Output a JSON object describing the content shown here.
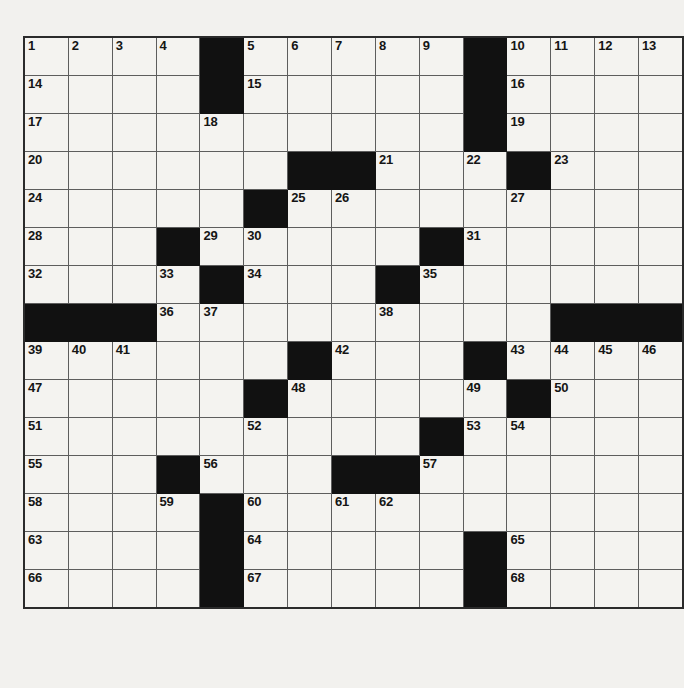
{
  "puzzle": {
    "title": "Crossword Puzzle Grid",
    "rows": 17,
    "columns": 14,
    "cell_width_px": 46,
    "cell_height_px": 37,
    "colors": {
      "paper_background": "#f2f1ee",
      "cell_background": "#f4f3f0",
      "block_fill": "#111111",
      "grid_line": "#5d5d5d",
      "outer_border": "#2b2b2b",
      "number_text": "#151515"
    },
    "highest_clue_number": 68,
    "total_cells": 238,
    "block_count": 46,
    "legend": {
      "block_label": "blocked-square",
      "open_label": "open-square"
    },
    "grid": [
      [
        {
          "type": "open",
          "number": "1"
        },
        {
          "type": "open",
          "number": "2"
        },
        {
          "type": "open",
          "number": "3"
        },
        {
          "type": "open",
          "number": "4"
        },
        {
          "type": "block",
          "number": ""
        },
        {
          "type": "open",
          "number": "5"
        },
        {
          "type": "open",
          "number": "6"
        },
        {
          "type": "open",
          "number": "7"
        },
        {
          "type": "open",
          "number": "8"
        },
        {
          "type": "open",
          "number": "9"
        },
        {
          "type": "block",
          "number": ""
        },
        {
          "type": "open",
          "number": "10"
        },
        {
          "type": "open",
          "number": "11"
        },
        {
          "type": "open",
          "number": "12"
        },
        {
          "type": "open",
          "number": "13"
        }
      ],
      [
        {
          "type": "open",
          "number": "14"
        },
        {
          "type": "open",
          "number": ""
        },
        {
          "type": "open",
          "number": ""
        },
        {
          "type": "open",
          "number": ""
        },
        {
          "type": "block",
          "number": ""
        },
        {
          "type": "open",
          "number": "15"
        },
        {
          "type": "open",
          "number": ""
        },
        {
          "type": "open",
          "number": ""
        },
        {
          "type": "open",
          "number": ""
        },
        {
          "type": "open",
          "number": ""
        },
        {
          "type": "block",
          "number": ""
        },
        {
          "type": "open",
          "number": "16"
        },
        {
          "type": "open",
          "number": ""
        },
        {
          "type": "open",
          "number": ""
        },
        {
          "type": "open",
          "number": ""
        }
      ],
      [
        {
          "type": "open",
          "number": "17"
        },
        {
          "type": "open",
          "number": ""
        },
        {
          "type": "open",
          "number": ""
        },
        {
          "type": "open",
          "number": ""
        },
        {
          "type": "open",
          "number": "18"
        },
        {
          "type": "open",
          "number": ""
        },
        {
          "type": "open",
          "number": ""
        },
        {
          "type": "open",
          "number": ""
        },
        {
          "type": "open",
          "number": ""
        },
        {
          "type": "open",
          "number": ""
        },
        {
          "type": "block",
          "number": ""
        },
        {
          "type": "open",
          "number": "19"
        },
        {
          "type": "open",
          "number": ""
        },
        {
          "type": "open",
          "number": ""
        },
        {
          "type": "open",
          "number": ""
        }
      ],
      [
        {
          "type": "open",
          "number": "20"
        },
        {
          "type": "open",
          "number": ""
        },
        {
          "type": "open",
          "number": ""
        },
        {
          "type": "open",
          "number": ""
        },
        {
          "type": "open",
          "number": ""
        },
        {
          "type": "open",
          "number": ""
        },
        {
          "type": "block",
          "number": ""
        },
        {
          "type": "block",
          "number": ""
        },
        {
          "type": "open",
          "number": "21"
        },
        {
          "type": "open",
          "number": ""
        },
        {
          "type": "open",
          "number": "22"
        },
        {
          "type": "block",
          "number": ""
        },
        {
          "type": "open",
          "number": "23"
        },
        {
          "type": "open",
          "number": ""
        },
        {
          "type": "open",
          "number": ""
        }
      ],
      [
        {
          "type": "open",
          "number": "24"
        },
        {
          "type": "open",
          "number": ""
        },
        {
          "type": "open",
          "number": ""
        },
        {
          "type": "open",
          "number": ""
        },
        {
          "type": "open",
          "number": ""
        },
        {
          "type": "block",
          "number": ""
        },
        {
          "type": "open",
          "number": "25"
        },
        {
          "type": "open",
          "number": "26"
        },
        {
          "type": "open",
          "number": ""
        },
        {
          "type": "open",
          "number": ""
        },
        {
          "type": "open",
          "number": ""
        },
        {
          "type": "open",
          "number": "27"
        },
        {
          "type": "open",
          "number": ""
        },
        {
          "type": "open",
          "number": ""
        },
        {
          "type": "open",
          "number": ""
        }
      ],
      [
        {
          "type": "open",
          "number": "28"
        },
        {
          "type": "open",
          "number": ""
        },
        {
          "type": "open",
          "number": ""
        },
        {
          "type": "block",
          "number": ""
        },
        {
          "type": "open",
          "number": "29"
        },
        {
          "type": "open",
          "number": "30"
        },
        {
          "type": "open",
          "number": ""
        },
        {
          "type": "open",
          "number": ""
        },
        {
          "type": "open",
          "number": ""
        },
        {
          "type": "block",
          "number": ""
        },
        {
          "type": "open",
          "number": "31"
        },
        {
          "type": "open",
          "number": ""
        },
        {
          "type": "open",
          "number": ""
        },
        {
          "type": "open",
          "number": ""
        },
        {
          "type": "open",
          "number": ""
        }
      ],
      [
        {
          "type": "open",
          "number": "32"
        },
        {
          "type": "open",
          "number": ""
        },
        {
          "type": "open",
          "number": ""
        },
        {
          "type": "open",
          "number": "33"
        },
        {
          "type": "block",
          "number": ""
        },
        {
          "type": "open",
          "number": "34"
        },
        {
          "type": "open",
          "number": ""
        },
        {
          "type": "open",
          "number": ""
        },
        {
          "type": "block",
          "number": ""
        },
        {
          "type": "open",
          "number": "35"
        },
        {
          "type": "open",
          "number": ""
        },
        {
          "type": "open",
          "number": ""
        },
        {
          "type": "open",
          "number": ""
        },
        {
          "type": "open",
          "number": ""
        },
        {
          "type": "open",
          "number": ""
        }
      ],
      [
        {
          "type": "block",
          "number": ""
        },
        {
          "type": "block",
          "number": ""
        },
        {
          "type": "block",
          "number": ""
        },
        {
          "type": "open",
          "number": "36"
        },
        {
          "type": "open",
          "number": "37"
        },
        {
          "type": "open",
          "number": ""
        },
        {
          "type": "open",
          "number": ""
        },
        {
          "type": "open",
          "number": ""
        },
        {
          "type": "open",
          "number": "38"
        },
        {
          "type": "open",
          "number": ""
        },
        {
          "type": "open",
          "number": ""
        },
        {
          "type": "open",
          "number": ""
        },
        {
          "type": "block",
          "number": ""
        },
        {
          "type": "block",
          "number": ""
        },
        {
          "type": "block",
          "number": ""
        }
      ],
      [
        {
          "type": "open",
          "number": "39"
        },
        {
          "type": "open",
          "number": "40"
        },
        {
          "type": "open",
          "number": "41"
        },
        {
          "type": "open",
          "number": ""
        },
        {
          "type": "open",
          "number": ""
        },
        {
          "type": "open",
          "number": ""
        },
        {
          "type": "block",
          "number": ""
        },
        {
          "type": "open",
          "number": "42"
        },
        {
          "type": "open",
          "number": ""
        },
        {
          "type": "open",
          "number": ""
        },
        {
          "type": "block",
          "number": ""
        },
        {
          "type": "open",
          "number": "43"
        },
        {
          "type": "open",
          "number": "44"
        },
        {
          "type": "open",
          "number": "45"
        },
        {
          "type": "open",
          "number": "46"
        }
      ],
      [
        {
          "type": "open",
          "number": "47"
        },
        {
          "type": "open",
          "number": ""
        },
        {
          "type": "open",
          "number": ""
        },
        {
          "type": "open",
          "number": ""
        },
        {
          "type": "open",
          "number": ""
        },
        {
          "type": "block",
          "number": ""
        },
        {
          "type": "open",
          "number": "48"
        },
        {
          "type": "open",
          "number": ""
        },
        {
          "type": "open",
          "number": ""
        },
        {
          "type": "open",
          "number": ""
        },
        {
          "type": "open",
          "number": "49"
        },
        {
          "type": "block",
          "number": ""
        },
        {
          "type": "open",
          "number": "50"
        },
        {
          "type": "open",
          "number": ""
        },
        {
          "type": "open",
          "number": ""
        }
      ],
      [
        {
          "type": "open",
          "number": "51"
        },
        {
          "type": "open",
          "number": ""
        },
        {
          "type": "open",
          "number": ""
        },
        {
          "type": "open",
          "number": ""
        },
        {
          "type": "open",
          "number": ""
        },
        {
          "type": "open",
          "number": "52"
        },
        {
          "type": "open",
          "number": ""
        },
        {
          "type": "open",
          "number": ""
        },
        {
          "type": "open",
          "number": ""
        },
        {
          "type": "block",
          "number": ""
        },
        {
          "type": "open",
          "number": "53"
        },
        {
          "type": "open",
          "number": "54"
        },
        {
          "type": "open",
          "number": ""
        },
        {
          "type": "open",
          "number": ""
        },
        {
          "type": "open",
          "number": ""
        }
      ],
      [
        {
          "type": "open",
          "number": "55"
        },
        {
          "type": "open",
          "number": ""
        },
        {
          "type": "open",
          "number": ""
        },
        {
          "type": "block",
          "number": ""
        },
        {
          "type": "open",
          "number": "56"
        },
        {
          "type": "open",
          "number": ""
        },
        {
          "type": "open",
          "number": ""
        },
        {
          "type": "block",
          "number": ""
        },
        {
          "type": "block",
          "number": ""
        },
        {
          "type": "open",
          "number": "57"
        },
        {
          "type": "open",
          "number": ""
        },
        {
          "type": "open",
          "number": ""
        },
        {
          "type": "open",
          "number": ""
        },
        {
          "type": "open",
          "number": ""
        },
        {
          "type": "open",
          "number": ""
        }
      ],
      [
        {
          "type": "open",
          "number": "58"
        },
        {
          "type": "open",
          "number": ""
        },
        {
          "type": "open",
          "number": ""
        },
        {
          "type": "open",
          "number": "59"
        },
        {
          "type": "block",
          "number": ""
        },
        {
          "type": "open",
          "number": "60"
        },
        {
          "type": "open",
          "number": ""
        },
        {
          "type": "open",
          "number": "61"
        },
        {
          "type": "open",
          "number": "62"
        },
        {
          "type": "open",
          "number": ""
        },
        {
          "type": "open",
          "number": ""
        },
        {
          "type": "open",
          "number": ""
        },
        {
          "type": "open",
          "number": ""
        },
        {
          "type": "open",
          "number": ""
        },
        {
          "type": "open",
          "number": ""
        }
      ],
      [
        {
          "type": "open",
          "number": "63"
        },
        {
          "type": "open",
          "number": ""
        },
        {
          "type": "open",
          "number": ""
        },
        {
          "type": "open",
          "number": ""
        },
        {
          "type": "block",
          "number": ""
        },
        {
          "type": "open",
          "number": "64"
        },
        {
          "type": "open",
          "number": ""
        },
        {
          "type": "open",
          "number": ""
        },
        {
          "type": "open",
          "number": ""
        },
        {
          "type": "open",
          "number": ""
        },
        {
          "type": "block",
          "number": ""
        },
        {
          "type": "open",
          "number": "65"
        },
        {
          "type": "open",
          "number": ""
        },
        {
          "type": "open",
          "number": ""
        },
        {
          "type": "open",
          "number": ""
        }
      ],
      [
        {
          "type": "open",
          "number": "66"
        },
        {
          "type": "open",
          "number": ""
        },
        {
          "type": "open",
          "number": ""
        },
        {
          "type": "open",
          "number": ""
        },
        {
          "type": "block",
          "number": ""
        },
        {
          "type": "open",
          "number": "67"
        },
        {
          "type": "open",
          "number": ""
        },
        {
          "type": "open",
          "number": ""
        },
        {
          "type": "open",
          "number": ""
        },
        {
          "type": "open",
          "number": ""
        },
        {
          "type": "block",
          "number": ""
        },
        {
          "type": "open",
          "number": "68"
        },
        {
          "type": "open",
          "number": ""
        },
        {
          "type": "open",
          "number": ""
        },
        {
          "type": "open",
          "number": ""
        }
      ]
    ]
  }
}
